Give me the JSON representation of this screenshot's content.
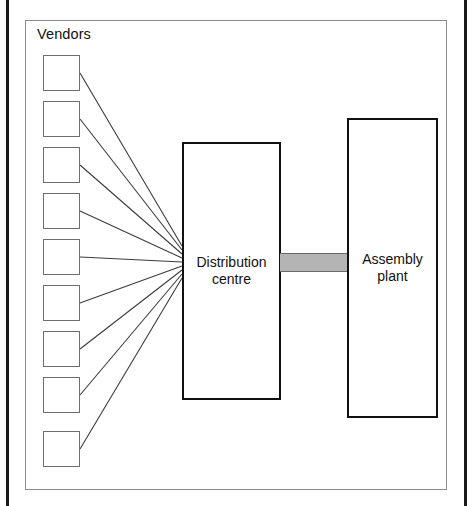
{
  "figure": {
    "title": "Vendors",
    "background_color": "#ffffff",
    "frame_color": "#8a8a8a",
    "node_border_color": "#111111",
    "vendor_border_color": "#6e6e6e",
    "link_color": "#3c3c3c",
    "conveyor_color": "#b4b4b4"
  },
  "vendors": {
    "count": 9,
    "label": "Vendors",
    "boxes": [
      {
        "name": "vendor-box-1",
        "x": 43,
        "y": 55
      },
      {
        "name": "vendor-box-2",
        "x": 43,
        "y": 101
      },
      {
        "name": "vendor-box-3",
        "x": 43,
        "y": 147
      },
      {
        "name": "vendor-box-4",
        "x": 43,
        "y": 193
      },
      {
        "name": "vendor-box-5",
        "x": 43,
        "y": 239
      },
      {
        "name": "vendor-box-6",
        "x": 43,
        "y": 285
      },
      {
        "name": "vendor-box-7",
        "x": 43,
        "y": 331
      },
      {
        "name": "vendor-box-8",
        "x": 43,
        "y": 377
      },
      {
        "name": "vendor-box-9",
        "x": 43,
        "y": 431
      }
    ]
  },
  "nodes": {
    "distribution_centre": {
      "label_line1": "Distribution",
      "label_line2": "centre"
    },
    "assembly_plant": {
      "label_line1": "Assembly",
      "label_line2": "plant"
    }
  },
  "links": {
    "description": "nine vendor supply lines converging on distribution centre",
    "hub_x": 182,
    "edges": [
      {
        "from": "vendor-box-1",
        "x1": 80,
        "y1": 73,
        "x2": 182,
        "y2": 246
      },
      {
        "from": "vendor-box-2",
        "x1": 80,
        "y1": 119,
        "x2": 182,
        "y2": 250
      },
      {
        "from": "vendor-box-3",
        "x1": 80,
        "y1": 165,
        "x2": 182,
        "y2": 254
      },
      {
        "from": "vendor-box-4",
        "x1": 80,
        "y1": 211,
        "x2": 182,
        "y2": 258
      },
      {
        "from": "vendor-box-5",
        "x1": 80,
        "y1": 257,
        "x2": 182,
        "y2": 262
      },
      {
        "from": "vendor-box-6",
        "x1": 80,
        "y1": 303,
        "x2": 182,
        "y2": 266
      },
      {
        "from": "vendor-box-7",
        "x1": 80,
        "y1": 349,
        "x2": 182,
        "y2": 270
      },
      {
        "from": "vendor-box-8",
        "x1": 80,
        "y1": 395,
        "x2": 182,
        "y2": 274
      },
      {
        "from": "vendor-box-9",
        "x1": 80,
        "y1": 449,
        "x2": 182,
        "y2": 278
      }
    ]
  },
  "conveyor": {
    "name": "conveyor-link",
    "from": "distribution_centre",
    "to": "assembly_plant"
  }
}
